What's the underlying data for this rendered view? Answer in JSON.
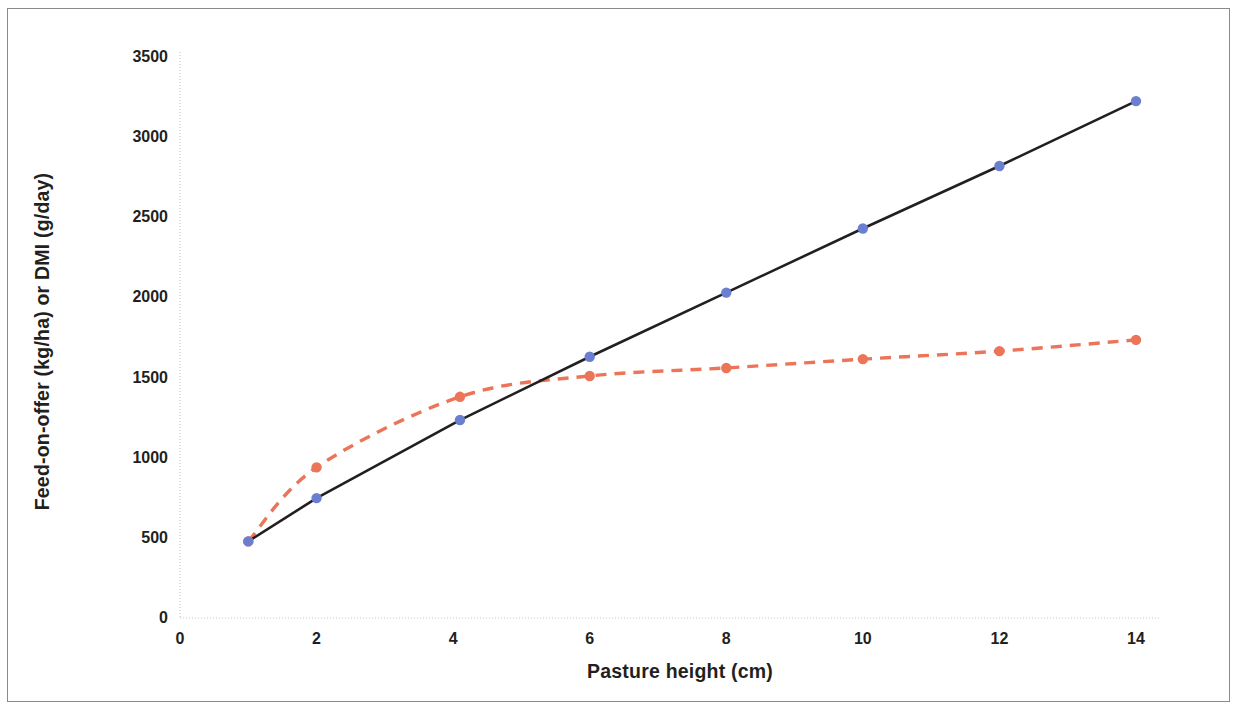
{
  "figure": {
    "border_color": "#8a8a8a",
    "background": "#ffffff"
  },
  "chart_data": {
    "type": "line",
    "title": "",
    "xlabel": "Pasture height (cm)",
    "ylabel": "Feed-on-offer (kg/ha) or DMI (g/day)",
    "xlim": [
      0,
      14.6
    ],
    "ylim": [
      0,
      3500
    ],
    "xticks": [
      0,
      2,
      4,
      6,
      8,
      10,
      12,
      14
    ],
    "xtick_labels": [
      "0",
      "2",
      "4",
      "6",
      "8",
      "10",
      "12",
      "14"
    ],
    "yticks": [
      0,
      500,
      1000,
      1500,
      2000,
      2500,
      3000,
      3500
    ],
    "ytick_labels": [
      "0",
      "500",
      "1000",
      "1500",
      "2000",
      "2500",
      "3000",
      "3500"
    ],
    "grid": false,
    "legend": "none",
    "series": [
      {
        "name": "Feed-on-offer (kg/ha)",
        "style": "dashed",
        "color": "#EB7459",
        "marker": "circle",
        "marker_color": "#EB7459",
        "x": [
          1,
          2,
          4.1,
          6,
          8,
          10,
          12,
          14
        ],
        "values": [
          478,
          940,
          1380,
          1510,
          1560,
          1615,
          1665,
          1735
        ]
      },
      {
        "name": "DMI (g/day)",
        "style": "solid",
        "color": "#231f20",
        "marker": "circle",
        "marker_color": "#6B7FD0",
        "x": [
          1,
          2,
          4.1,
          6,
          8,
          10,
          12,
          14
        ],
        "values": [
          478,
          748,
          1235,
          1630,
          2030,
          2430,
          2820,
          3225
        ]
      }
    ]
  }
}
